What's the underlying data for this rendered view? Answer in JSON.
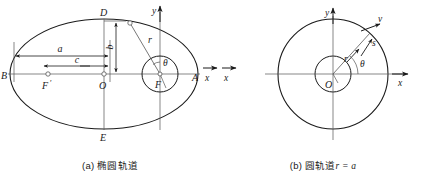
{
  "figure": {
    "panels": [
      {
        "id": "a",
        "caption_prefix": "(a)",
        "caption_text": "椭圆轨道",
        "caption_math": "",
        "axes": {
          "y_label": "y",
          "x_label": "x"
        },
        "points": [
          {
            "name": "A",
            "label": "A"
          },
          {
            "name": "B",
            "label": "B"
          },
          {
            "name": "D",
            "label": "D"
          },
          {
            "name": "E",
            "label": "E"
          },
          {
            "name": "O",
            "label": "O"
          },
          {
            "name": "F",
            "label": "F"
          },
          {
            "name": "F-prime",
            "label": "F"
          }
        ],
        "dimensions": [
          {
            "name": "semi-major-axis",
            "label": "a"
          },
          {
            "name": "focal-distance",
            "label": "c"
          },
          {
            "name": "semi-minor-axis",
            "label": "b"
          }
        ],
        "vectors": [
          {
            "name": "radius",
            "label": "r"
          }
        ],
        "angles": [
          {
            "name": "true-anomaly",
            "label": "θ"
          }
        ]
      },
      {
        "id": "b",
        "caption_prefix": "(b)",
        "caption_text": "圆轨道",
        "caption_math": "r = a",
        "axes": {
          "y_label": "y",
          "x_label": "x"
        },
        "points": [
          {
            "name": "O",
            "label": "O"
          }
        ],
        "vectors": [
          {
            "name": "radius",
            "label": "r"
          },
          {
            "name": "velocity",
            "label": "v"
          },
          {
            "name": "arc-length",
            "label": "s"
          }
        ],
        "angles": [
          {
            "name": "polar-angle",
            "label": "θ"
          }
        ]
      }
    ],
    "colors": {
      "stroke": "#1a1a1a",
      "thin_stroke": "#555555",
      "background": "#ffffff"
    }
  }
}
